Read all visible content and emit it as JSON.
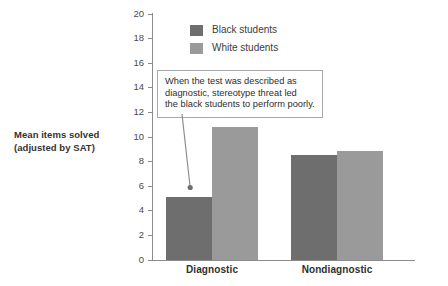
{
  "chart_data": {
    "type": "bar",
    "title": "",
    "subtitle": "",
    "xlabel": "",
    "ylabel": "Mean items solved (adjusted by SAT)",
    "ylabel_lines": [
      "Mean items solved",
      "(adjusted by SAT)"
    ],
    "categories": [
      "Diagnostic",
      "Nondiagnostic"
    ],
    "series": [
      {
        "name": "Black students",
        "color": "#6e6e6e",
        "values": [
          5.1,
          8.5
        ]
      },
      {
        "name": "White students",
        "color": "#9a9a9a",
        "values": [
          10.8,
          8.9
        ]
      }
    ],
    "ylim": [
      0,
      20
    ],
    "ytick_step": 2,
    "yticks": [
      "20",
      "18",
      "16",
      "14",
      "12",
      "10",
      "8",
      "6",
      "4",
      "2",
      "0"
    ],
    "ytick_values": [
      20,
      18,
      16,
      14,
      12,
      10,
      8,
      6,
      4,
      2,
      0
    ],
    "grid": false,
    "legend_position": "top-left-inside",
    "annotations": [
      {
        "id": "stereotype-threat-note",
        "lines": [
          "When the test was described as",
          "diagnostic, stereotype threat led",
          "the black students to perform poorly."
        ],
        "text": "When the test was described as diagnostic, stereotype threat led the black students to perform poorly.",
        "points_to": "Black students / Diagnostic bar"
      }
    ],
    "axis_color": "#8b8b8b",
    "background": "#ffffff"
  }
}
